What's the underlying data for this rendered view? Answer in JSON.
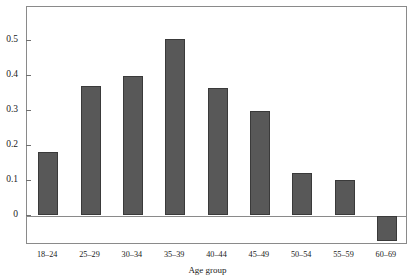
{
  "chart_data": {
    "type": "bar",
    "title": "",
    "xlabel": "Age group",
    "ylabel": "",
    "categories": [
      "18–24",
      "25–29",
      "30–34",
      "35–39",
      "40–44",
      "45–49",
      "50–54",
      "55–59",
      "60–69"
    ],
    "values": [
      0.182,
      0.371,
      0.401,
      0.505,
      0.365,
      0.298,
      0.122,
      0.102,
      -0.072
    ],
    "ytick_labels": [
      "0.5",
      "0.4",
      "0.3",
      "0.2",
      "0.1",
      "0"
    ],
    "ytick_values": [
      0.5,
      0.4,
      0.3,
      0.2,
      0.1,
      0
    ],
    "ylim": [
      -0.08,
      0.57
    ],
    "grid": false,
    "legend": null,
    "bar_color": "#585858",
    "bar_edge_color": "#3a3a3a",
    "axis_color": "#8a8a8a"
  }
}
